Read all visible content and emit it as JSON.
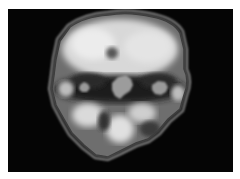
{
  "image": {
    "description": "Grayscale coronal brain scan (SPECT/PET-style) on black background",
    "alt": "brain scan",
    "colors": {
      "background": "#050505",
      "border": "#ffffff",
      "tissue_bright": "#e6e6e6",
      "tissue_mid": "#8a8a8a",
      "tissue_dark": "#2a2a2a",
      "outline": "#9a9a9a"
    }
  }
}
